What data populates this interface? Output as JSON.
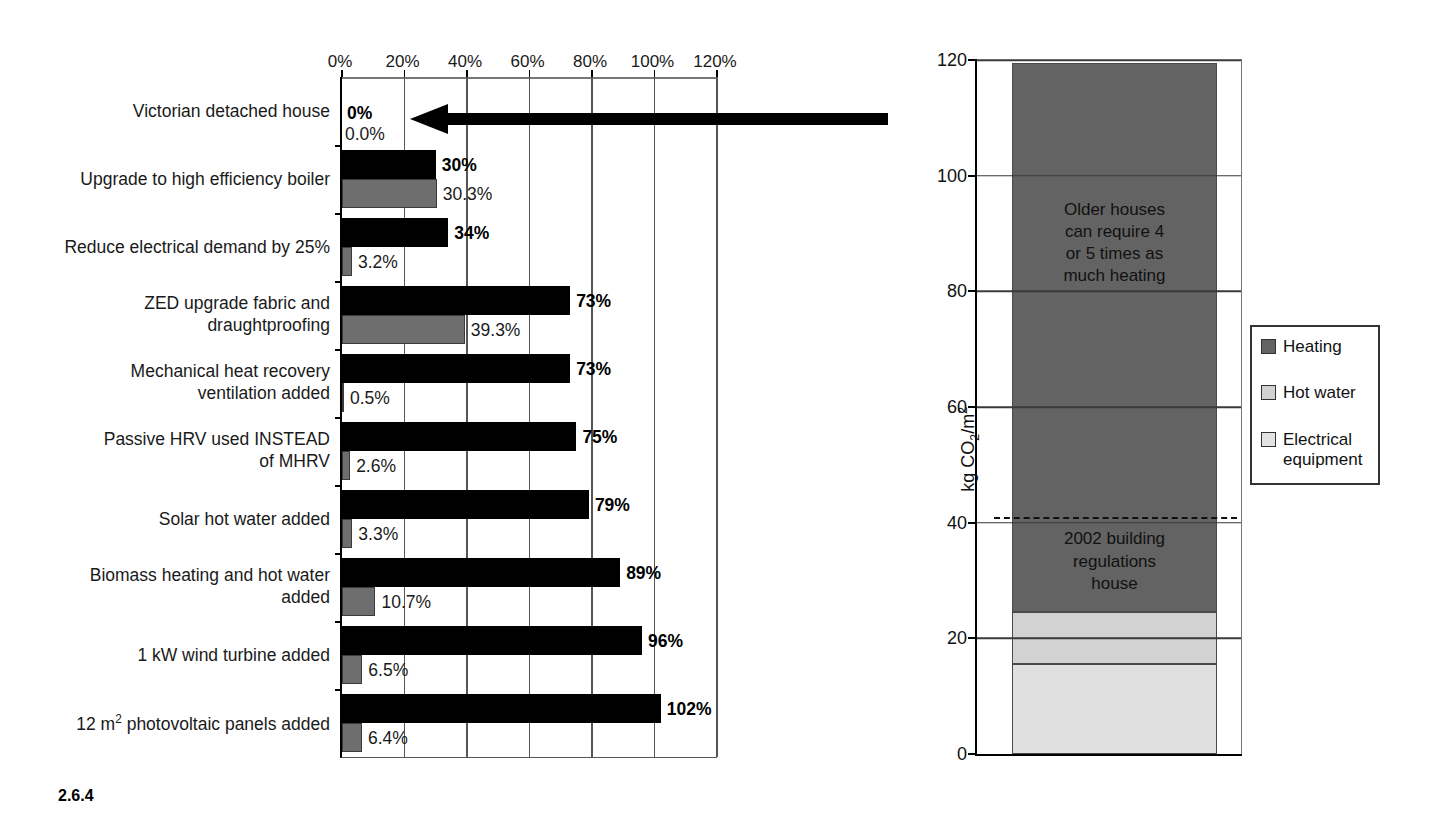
{
  "caption": "2.6.4",
  "chart_data": [
    {
      "type": "bar",
      "orientation": "horizontal",
      "title": "",
      "xlabel": "",
      "ylabel": "",
      "xlim": [
        0,
        120
      ],
      "xticks": [
        0,
        20,
        40,
        60,
        80,
        100,
        120
      ],
      "xtick_labels": [
        "0%",
        "20%",
        "40%",
        "60%",
        "80%",
        "100%",
        "120%"
      ],
      "grid": true,
      "legend": "none",
      "categories": [
        "Victorian detached house",
        "Upgrade to high efficiency boiler",
        "Reduce electrical demand by 25%",
        "ZED upgrade fabric and\ndraughtproofing",
        "Mechanical heat recovery\nventilation added",
        "Passive HRV used INSTEAD\nof MHRV",
        "Solar hot water added",
        "Biomass heating and hot water\nadded",
        "1 kW wind turbine added",
        "12 m2 photovoltaic panels added"
      ],
      "series": [
        {
          "name": "primary",
          "color": "#000000",
          "values": [
            0,
            30,
            34,
            73,
            73,
            75,
            79,
            89,
            96,
            102
          ],
          "labels": [
            "0%",
            "30%",
            "34%",
            "73%",
            "73%",
            "75%",
            "79%",
            "89%",
            "96%",
            "102%"
          ]
        },
        {
          "name": "secondary",
          "color": "#6e6e6e",
          "values": [
            0.0,
            30.3,
            3.2,
            39.3,
            0.5,
            2.6,
            3.3,
            10.7,
            6.5,
            6.4
          ],
          "labels": [
            "0.0%",
            "30.3%",
            "3.2%",
            "39.3%",
            "0.5%",
            "2.6%",
            "3.3%",
            "10.7%",
            "6.5%",
            "6.4%"
          ]
        }
      ],
      "annotations": [
        {
          "name": "zero-baseline-arrow",
          "direction": "left",
          "row": 0
        }
      ]
    },
    {
      "type": "bar",
      "orientation": "vertical",
      "stacked": true,
      "title": "",
      "xlabel": "",
      "ylabel": "kg CO2/m2",
      "ylim": [
        0,
        120
      ],
      "yticks": [
        0,
        20,
        40,
        60,
        80,
        100,
        120
      ],
      "ytick_labels": [
        "0",
        "20",
        "40",
        "60",
        "80",
        "100",
        "120"
      ],
      "grid": true,
      "legend_position": "right",
      "categories": [
        "Victorian detached house"
      ],
      "series": [
        {
          "name": "Electrical equipment",
          "color": "#e0e0e0",
          "values": [
            15.5
          ]
        },
        {
          "name": "Hot water",
          "color": "#d2d2d2",
          "values": [
            9.0
          ]
        },
        {
          "name": "Heating",
          "color": "#636363",
          "values": [
            95.0
          ]
        }
      ],
      "threshold": {
        "value": 41,
        "style": "dashed",
        "label": "2002 building regulations house"
      },
      "annotations": [
        {
          "text": "Older houses\ncan require 4\nor 5 times as\nmuch heating",
          "at_value": 88
        },
        {
          "text": "2002 building\nregulations\nhouse",
          "at_value": 33
        }
      ]
    }
  ],
  "left_chart": {
    "xtick_labels": [
      "0%",
      "20%",
      "40%",
      "60%",
      "80%",
      "100%",
      "120%"
    ],
    "rows": [
      {
        "label": "Victorian detached house",
        "primary_label": "0%",
        "secondary_label": "0.0%",
        "primary": 0,
        "secondary": 0.0
      },
      {
        "label": "Upgrade to high efficiency boiler",
        "primary_label": "30%",
        "secondary_label": "30.3%",
        "primary": 30,
        "secondary": 30.3
      },
      {
        "label": "Reduce electrical demand by 25%",
        "primary_label": "34%",
        "secondary_label": "3.2%",
        "primary": 34,
        "secondary": 3.2
      },
      {
        "label": "ZED upgrade fabric and\ndraughtproofing",
        "primary_label": "73%",
        "secondary_label": "39.3%",
        "primary": 73,
        "secondary": 39.3
      },
      {
        "label": "Mechanical heat recovery\nventilation added",
        "primary_label": "73%",
        "secondary_label": "0.5%",
        "primary": 73,
        "secondary": 0.5
      },
      {
        "label": "Passive HRV used INSTEAD\nof MHRV",
        "primary_label": "75%",
        "secondary_label": "2.6%",
        "primary": 75,
        "secondary": 2.6
      },
      {
        "label": "Solar hot water added",
        "primary_label": "79%",
        "secondary_label": "3.3%",
        "primary": 79,
        "secondary": 3.3
      },
      {
        "label": "Biomass heating and hot water\nadded",
        "primary_label": "89%",
        "secondary_label": "10.7%",
        "primary": 89,
        "secondary": 10.7
      },
      {
        "label": "1 kW wind turbine added",
        "primary_label": "96%",
        "secondary_label": "6.5%",
        "primary": 96,
        "secondary": 6.5
      },
      {
        "label": "12 m2 photovoltaic panels added",
        "primary_label": "102%",
        "secondary_label": "6.4%",
        "primary": 102,
        "secondary": 6.4
      }
    ]
  },
  "right_chart": {
    "ytick_labels": [
      "0",
      "20",
      "40",
      "60",
      "80",
      "100",
      "120"
    ],
    "y_axis_title": "kg CO2/m2",
    "annotation_top": "Older houses\ncan require 4\nor 5 times as\nmuch heating",
    "annotation_bottom": "2002 building\nregulations\nhouse",
    "legend": {
      "items": [
        {
          "label": "Heating",
          "color": "#636363"
        },
        {
          "label": "Hot water",
          "color": "#d2d2d2"
        },
        {
          "label": "Electrical\nequipment",
          "color": "#e2e2e2"
        }
      ]
    },
    "segments": [
      {
        "name": "Electrical equipment",
        "from": 0,
        "to": 15.5,
        "color": "#e0e0e0"
      },
      {
        "name": "Hot water",
        "from": 15.5,
        "to": 24.5,
        "color": "#d2d2d2"
      },
      {
        "name": "Heating",
        "from": 24.5,
        "to": 119.5,
        "color": "#636363"
      }
    ],
    "threshold_value": 41
  }
}
